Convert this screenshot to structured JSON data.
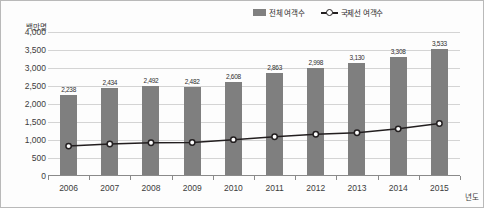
{
  "chart_data": {
    "type": "bar",
    "title": "",
    "xlabel": "년도",
    "ylabel": "백만명",
    "ylim": [
      0,
      4000
    ],
    "ytick_labels": [
      "4,000",
      "3,500",
      "3,000",
      "2,500",
      "2,000",
      "1,500",
      "1,000",
      "500",
      "0"
    ],
    "ytick_values": [
      4000,
      3500,
      3000,
      2500,
      2000,
      1500,
      1000,
      500,
      0
    ],
    "grid": true,
    "legend_position": "top-center-right",
    "categories": [
      "2006",
      "2007",
      "2008",
      "2009",
      "2010",
      "2011",
      "2012",
      "2013",
      "2014",
      "2015"
    ],
    "series": [
      {
        "name": "전체 여객수",
        "type": "bar",
        "color": "#7f7f7f",
        "values": [
          2238,
          2434,
          2492,
          2482,
          2608,
          2863,
          2998,
          3130,
          3308,
          3533
        ],
        "labels": [
          "2,238",
          "2,434",
          "2,492",
          "2,482",
          "2,608",
          "2,863",
          "2,998",
          "3,130",
          "3,308",
          "3,533"
        ]
      },
      {
        "name": "국제선 여객수",
        "type": "line",
        "color": "#231f20",
        "marker": "circle-open",
        "values": [
          830,
          890,
          925,
          930,
          1010,
          1090,
          1160,
          1200,
          1310,
          1460
        ],
        "labels": [
          "",
          "",
          "",
          "",
          "",
          "",
          "",
          "",
          "",
          ""
        ]
      }
    ]
  },
  "legend": {
    "entries": [
      {
        "label": "전체 여객수",
        "swatch": "bar-swatch"
      },
      {
        "label": "국제선 여객수",
        "swatch": "line-marker-swatch"
      }
    ]
  },
  "axes": {
    "y_unit": "백만명",
    "x_unit": "년도"
  },
  "colors": {
    "bar": "#7f7f7f",
    "line": "#231f20",
    "grid": "#d4d4d4",
    "axis": "#8a8a8a",
    "text": "#3c3c3c",
    "background": "#fdfdfd",
    "border": "#b9b9b9"
  }
}
